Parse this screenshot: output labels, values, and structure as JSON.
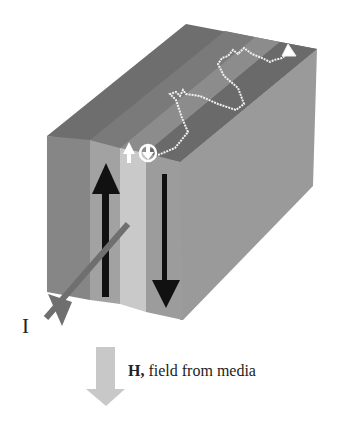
{
  "figure": {
    "current_label": "I",
    "field_symbol": "H,",
    "field_caption": "field from media"
  },
  "colors": {
    "background": "#ffffff",
    "top_face_dark": "#6e6e6e",
    "top_face_mid": "#7c7c7c",
    "top_face_light": "#8e8e8e",
    "front_dark": "#868686",
    "front_mid": "#a2a2a2",
    "front_light": "#c9c9c9",
    "right_face": "#9a9a9a",
    "magnetization_arrow": "#111111",
    "current_arrow": "#6f6f6f",
    "field_arrow": "#c8c8c8",
    "spin_trace": "#f2f2f2"
  }
}
